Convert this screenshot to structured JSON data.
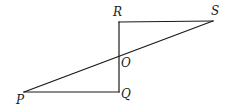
{
  "diagram": {
    "type": "geometry",
    "stroke_color": "#1a1a1a",
    "background": "#ffffff",
    "points": {
      "P": {
        "x": 24,
        "y": 92
      },
      "Q": {
        "x": 119,
        "y": 92
      },
      "R": {
        "x": 119,
        "y": 22
      },
      "S": {
        "x": 213,
        "y": 21
      },
      "O": {
        "x": 119,
        "y": 57
      }
    },
    "segments": [
      {
        "from": "R",
        "to": "S"
      },
      {
        "from": "R",
        "to": "Q"
      },
      {
        "from": "P",
        "to": "Q"
      },
      {
        "from": "P",
        "to": "S"
      }
    ],
    "labels": {
      "R": "R",
      "S": "S",
      "O": "O",
      "P": "P",
      "Q": "Q"
    }
  }
}
